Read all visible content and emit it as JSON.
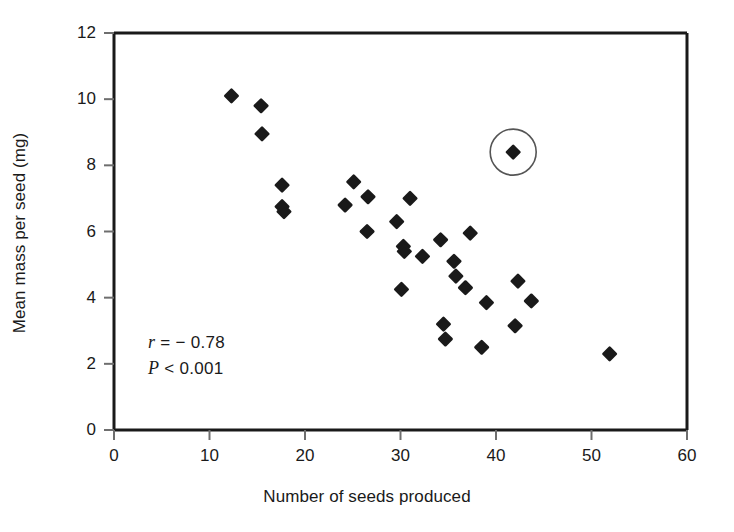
{
  "chart_data": {
    "type": "scatter",
    "title": "",
    "xlabel": "Number of seeds produced",
    "ylabel": "Mean mass per seed (mg)",
    "xlim": [
      0,
      60
    ],
    "ylim": [
      0,
      12
    ],
    "xticks": [
      0,
      10,
      20,
      30,
      40,
      50,
      60
    ],
    "yticks": [
      0,
      2,
      4,
      6,
      8,
      10,
      12
    ],
    "xtick_labels": [
      "0",
      "10",
      "20",
      "30",
      "40",
      "50",
      "60"
    ],
    "ytick_labels": [
      "0",
      "2",
      "4",
      "6",
      "8",
      "10",
      "12"
    ],
    "grid": false,
    "legend": null,
    "marker": "filled-diamond",
    "marker_color": "#1a1a1a",
    "points": [
      {
        "x": 12.3,
        "y": 10.1
      },
      {
        "x": 15.4,
        "y": 9.8
      },
      {
        "x": 15.5,
        "y": 8.95
      },
      {
        "x": 17.6,
        "y": 7.4
      },
      {
        "x": 17.6,
        "y": 6.75
      },
      {
        "x": 17.8,
        "y": 6.6
      },
      {
        "x": 24.2,
        "y": 6.8
      },
      {
        "x": 25.1,
        "y": 7.5
      },
      {
        "x": 26.6,
        "y": 7.05
      },
      {
        "x": 26.5,
        "y": 6.0
      },
      {
        "x": 29.6,
        "y": 6.3
      },
      {
        "x": 30.3,
        "y": 5.55
      },
      {
        "x": 30.4,
        "y": 5.4
      },
      {
        "x": 31.0,
        "y": 7.0
      },
      {
        "x": 30.1,
        "y": 4.25
      },
      {
        "x": 32.3,
        "y": 5.25
      },
      {
        "x": 34.2,
        "y": 5.75
      },
      {
        "x": 34.5,
        "y": 3.2
      },
      {
        "x": 34.7,
        "y": 2.75
      },
      {
        "x": 35.6,
        "y": 5.1
      },
      {
        "x": 35.8,
        "y": 4.65
      },
      {
        "x": 37.3,
        "y": 5.95
      },
      {
        "x": 36.8,
        "y": 4.3
      },
      {
        "x": 38.5,
        "y": 2.5
      },
      {
        "x": 39.0,
        "y": 3.85
      },
      {
        "x": 41.8,
        "y": 8.4
      },
      {
        "x": 42.3,
        "y": 4.5
      },
      {
        "x": 42.0,
        "y": 3.15
      },
      {
        "x": 43.7,
        "y": 3.9
      },
      {
        "x": 51.9,
        "y": 2.3
      }
    ],
    "highlight_circle": {
      "x": 41.8,
      "y": 8.4,
      "radius_px": 23,
      "stroke": "#555555",
      "label": "outlier-highlight"
    },
    "annotations": [
      {
        "name": "correlation",
        "italic": "r",
        "rest": " = − 0.78",
        "text": "r = − 0.78"
      },
      {
        "name": "p-value",
        "italic": "P",
        "rest": " < 0.001",
        "text": "P < 0.001"
      }
    ]
  },
  "annot": {
    "r_italic": "r",
    "r_rest": " = − 0.78",
    "p_italic": "P",
    "p_rest": " < 0.001"
  }
}
